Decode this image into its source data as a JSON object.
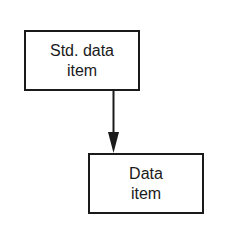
{
  "diagram": {
    "nodes": [
      {
        "id": "std-data-item",
        "lines": [
          "Std. data",
          "item"
        ]
      },
      {
        "id": "data-item",
        "lines": [
          "Data",
          "item"
        ]
      }
    ],
    "edges": [
      {
        "from": "std-data-item",
        "to": "data-item",
        "type": "arrow"
      }
    ],
    "colors": {
      "stroke": "#1a1a1a",
      "background": "#ffffff",
      "text": "#1a1a1a"
    }
  }
}
